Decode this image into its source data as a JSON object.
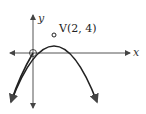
{
  "diagram": {
    "type": "parabola-graph",
    "axes": {
      "x_label": "x",
      "y_label": "y"
    },
    "vertex": {
      "label": "V(2, 4)",
      "x": 2,
      "y": 4
    },
    "curve": "downward-opening parabola through origin",
    "marked_points": [
      "origin",
      "vertex"
    ],
    "colors": {
      "curve": "#222222",
      "axis": "#555555"
    }
  }
}
